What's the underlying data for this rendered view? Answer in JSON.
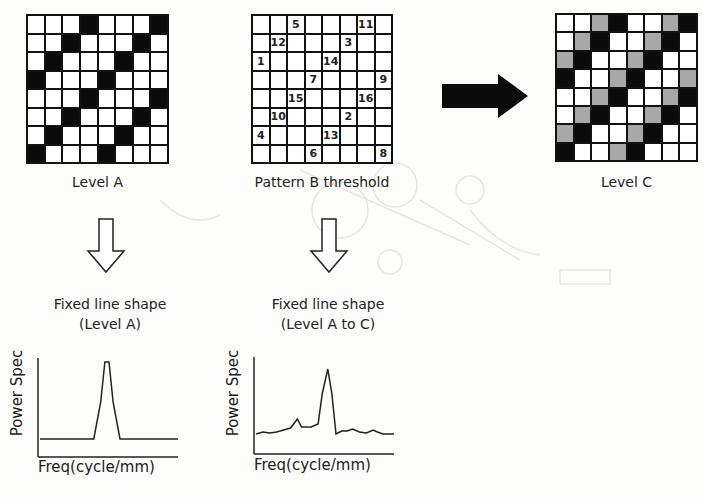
{
  "panels": {
    "level_a": {
      "label": "Level A",
      "grid": [
        "WWWBWWWB",
        "WWBWWWBW",
        "WBWWWBWW",
        "BWWWBWWW",
        "WWWBWWWB",
        "WWBWWWBW",
        "WBWWWBWW",
        "BWWWBWWW"
      ]
    },
    "pattern_b": {
      "label": "Pattern B threshold",
      "grid": [
        [
          "",
          "",
          "5",
          "",
          "",
          "",
          "11",
          ""
        ],
        [
          "",
          "12",
          "",
          "",
          "",
          "3",
          "",
          ""
        ],
        [
          "1",
          "",
          "",
          "",
          "14",
          "",
          "",
          ""
        ],
        [
          "",
          "",
          "",
          "7",
          "",
          "",
          "",
          "9"
        ],
        [
          "",
          "",
          "15",
          "",
          "",
          "",
          "16",
          ""
        ],
        [
          "",
          "10",
          "",
          "",
          "",
          "2",
          "",
          ""
        ],
        [
          "4",
          "",
          "",
          "",
          "13",
          "",
          "",
          ""
        ],
        [
          "",
          "",
          "",
          "6",
          "",
          "",
          "",
          "8"
        ]
      ]
    },
    "level_c": {
      "label": "Level C",
      "grid": [
        "WWGBWWGB",
        "WGBWWGBW",
        "GBWWGBWW",
        "BWWGBWWG",
        "WWGBWWGB",
        "WGBWWGBW",
        "GBWWGBWW",
        "BWWGBWWW"
      ]
    }
  },
  "arrows": {
    "right_arrow": "solid-right-arrow",
    "down_arrow_a": "hollow-down-arrow",
    "down_arrow_b": "hollow-down-arrow"
  },
  "colors": {
    "black_cell": "#0b0b0b",
    "gray_cell": "#a8a8a8",
    "white_cell": "#ffffff",
    "line": "#111111"
  },
  "charts": {
    "chart_a": {
      "title_line1": "Fixed line shape",
      "title_line2": "(Level A)",
      "ylabel": "Power Spec",
      "xlabel": "Freq(cycle/mm)"
    },
    "chart_b": {
      "title_line1": "Fixed line shape",
      "title_line2": "(Level A to C)",
      "ylabel": "Power Spec",
      "xlabel": "Freq(cycle/mm)"
    }
  },
  "chart_data": [
    {
      "type": "line",
      "title": "Fixed line shape (Level A)",
      "xlabel": "Freq(cycle/mm)",
      "ylabel": "Power Spec",
      "grid": false,
      "x": [
        0,
        0.39,
        0.44,
        0.47,
        0.5,
        0.53,
        0.58,
        1.0
      ],
      "values": [
        0.18,
        0.18,
        0.55,
        0.95,
        0.95,
        0.55,
        0.18,
        0.18
      ],
      "note": "flat baseline with single sharp peak near mid frequency"
    },
    {
      "type": "line",
      "title": "Fixed line shape (Level A to C)",
      "xlabel": "Freq(cycle/mm)",
      "ylabel": "Power Spec",
      "grid": false,
      "x": [
        0,
        0.05,
        0.1,
        0.15,
        0.2,
        0.25,
        0.3,
        0.33,
        0.36,
        0.4,
        0.45,
        0.48,
        0.52,
        0.55,
        0.58,
        0.62,
        0.66,
        0.7,
        0.75,
        0.8,
        0.85,
        0.88,
        0.92,
        1.0
      ],
      "values": [
        0.2,
        0.22,
        0.21,
        0.22,
        0.24,
        0.26,
        0.35,
        0.27,
        0.27,
        0.27,
        0.3,
        0.6,
        0.85,
        0.6,
        0.2,
        0.23,
        0.23,
        0.25,
        0.22,
        0.21,
        0.24,
        0.22,
        0.2,
        0.2
      ],
      "note": "noisy baseline with small bump near 0.33 and main peak near 0.52"
    }
  ]
}
